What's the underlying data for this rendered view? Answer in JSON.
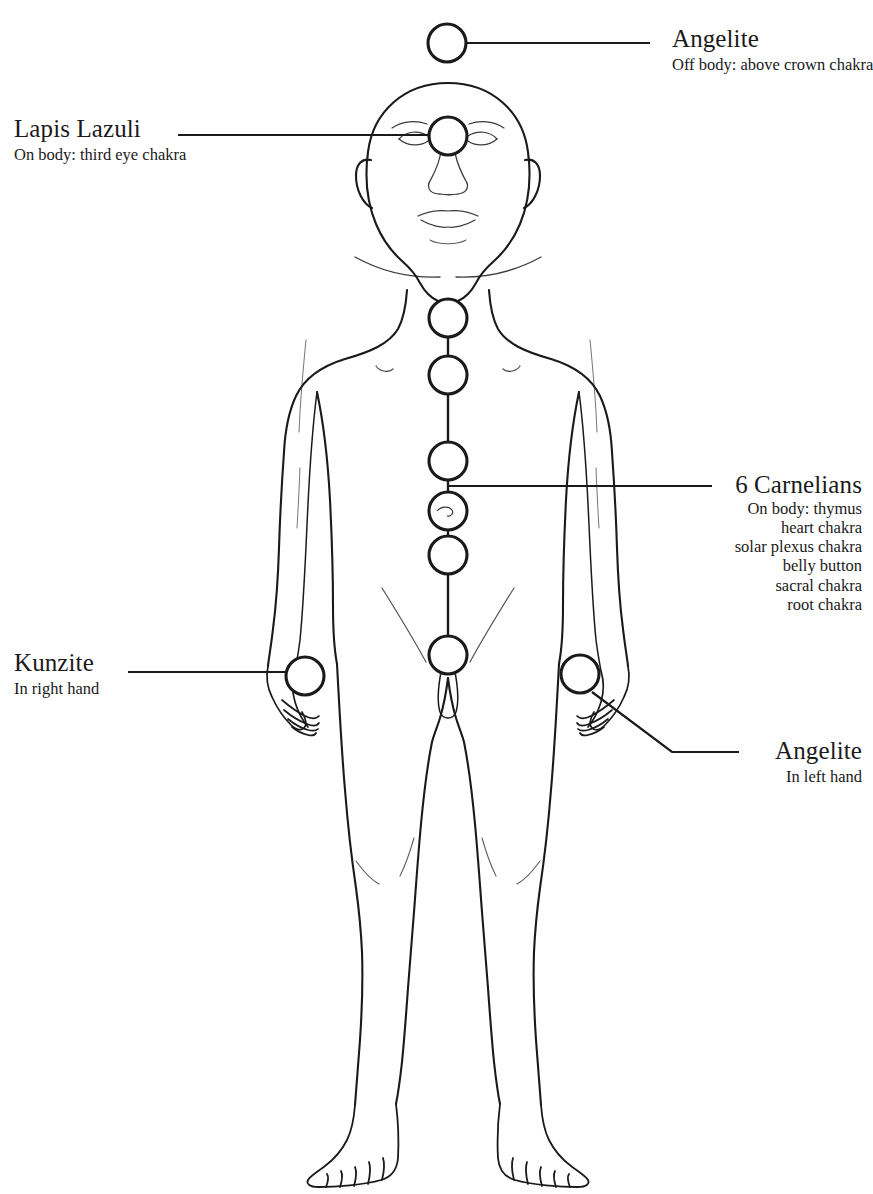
{
  "diagram": {
    "ink_color": "#1a1a1a",
    "background_color": "#ffffff",
    "figure": "front-facing nude male body outline, arms at sides, bald head"
  },
  "labels": {
    "crown": {
      "title": "Angelite",
      "subtitle": "Off body: above crown chakra"
    },
    "third_eye": {
      "title": "Lapis Lazuli",
      "subtitle": "On body: third eye chakra"
    },
    "carnelians": {
      "title": "6 Carnelians",
      "lines": [
        "On body: thymus",
        "heart chakra",
        "solar plexus chakra",
        "belly button",
        "sacral chakra",
        "root chakra"
      ]
    },
    "right_hand": {
      "title": "Kunzite",
      "subtitle": "In right hand"
    },
    "left_hand": {
      "title": "Angelite",
      "subtitle": "In left hand"
    }
  },
  "stones": [
    {
      "name": "crown-stone",
      "label": "Angelite",
      "cx": 447,
      "cy": 43,
      "r": 19
    },
    {
      "name": "third-eye-stone",
      "label": "Lapis Lazuli",
      "cx": 448,
      "cy": 136,
      "r": 19
    },
    {
      "name": "thymus-stone",
      "label": "Carnelian",
      "cx": 448,
      "cy": 318,
      "r": 19
    },
    {
      "name": "heart-stone",
      "label": "Carnelian",
      "cx": 448,
      "cy": 375,
      "r": 19
    },
    {
      "name": "solar-plexus-stone",
      "label": "Carnelian",
      "cx": 448,
      "cy": 461,
      "r": 19
    },
    {
      "name": "belly-button-stone",
      "label": "Carnelian",
      "cx": 448,
      "cy": 511,
      "r": 19
    },
    {
      "name": "sacral-stone",
      "label": "Carnelian",
      "cx": 448,
      "cy": 555,
      "r": 19
    },
    {
      "name": "root-stone",
      "label": "Carnelian",
      "cx": 448,
      "cy": 655,
      "r": 19
    },
    {
      "name": "right-hand-stone",
      "label": "Kunzite",
      "cx": 305,
      "cy": 676,
      "r": 19
    },
    {
      "name": "left-hand-stone",
      "label": "Angelite",
      "cx": 580,
      "cy": 674,
      "r": 19
    }
  ]
}
